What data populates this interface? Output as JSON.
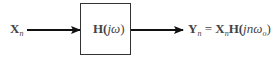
{
  "diagram": {
    "type": "block-diagram",
    "input": {
      "symbol": "X",
      "subscript": "n"
    },
    "block": {
      "prefix": "H(",
      "arg": "jω",
      "suffix": ")"
    },
    "output": {
      "lhs_symbol": "Y",
      "lhs_subscript": "n",
      "equals": "=",
      "rhs_symbol": "X",
      "rhs_subscript": "n",
      "rhs_func": "H(",
      "rhs_arg": "jnω",
      "rhs_arg_sub": "o",
      "rhs_close": ")"
    },
    "colors": {
      "line": "#111111",
      "box_border": "#333333",
      "text": "#444444"
    }
  }
}
